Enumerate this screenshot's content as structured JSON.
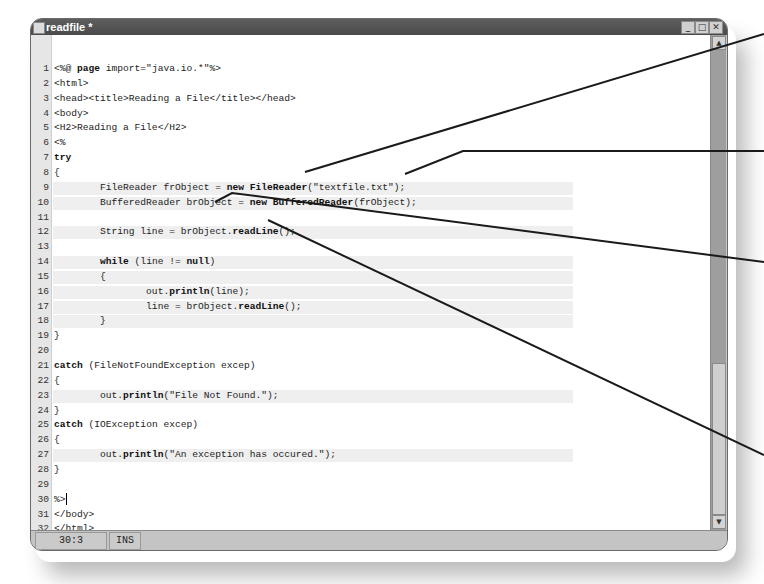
{
  "window": {
    "title": "readfile *",
    "buttons": {
      "minimize": "_",
      "maximize": "□",
      "close": "✕"
    }
  },
  "editor": {
    "lines": [
      {
        "n": "1",
        "segments": [
          {
            "t": "<%@ "
          },
          {
            "t": "page",
            "b": true
          },
          {
            "t": " import=\"java.io.*\"%>"
          }
        ]
      },
      {
        "n": "2",
        "segments": [
          {
            "t": "<html>"
          }
        ]
      },
      {
        "n": "3",
        "segments": [
          {
            "t": "<head><title>Reading a File</title></head>"
          }
        ]
      },
      {
        "n": "4",
        "segments": [
          {
            "t": "<body>"
          }
        ]
      },
      {
        "n": "5",
        "segments": [
          {
            "t": "<H2>Reading a File</H2>"
          }
        ]
      },
      {
        "n": "6",
        "segments": [
          {
            "t": "<%"
          }
        ]
      },
      {
        "n": "7",
        "segments": [
          {
            "t": "try",
            "b": true
          }
        ]
      },
      {
        "n": "8",
        "segments": [
          {
            "t": "{"
          }
        ]
      },
      {
        "n": "9",
        "hl": true,
        "segments": [
          {
            "t": "        FileReader frObject = "
          },
          {
            "t": "new FileReader",
            "b": true
          },
          {
            "t": "(\"textfile.txt\");"
          }
        ]
      },
      {
        "n": "10",
        "hl": true,
        "segments": [
          {
            "t": "        BufferedReader brObject = "
          },
          {
            "t": "new BufferedReader",
            "b": true
          },
          {
            "t": "(frObject);"
          }
        ]
      },
      {
        "n": "11",
        "segments": [
          {
            "t": ""
          }
        ]
      },
      {
        "n": "12",
        "hl": true,
        "segments": [
          {
            "t": "        String line = brObject."
          },
          {
            "t": "readLine",
            "b": true
          },
          {
            "t": "();"
          }
        ]
      },
      {
        "n": "13",
        "segments": [
          {
            "t": ""
          }
        ]
      },
      {
        "n": "14",
        "hl": true,
        "segments": [
          {
            "t": "        "
          },
          {
            "t": "while",
            "b": true
          },
          {
            "t": " (line != "
          },
          {
            "t": "null",
            "b": true
          },
          {
            "t": ")"
          }
        ]
      },
      {
        "n": "15",
        "hl": true,
        "segments": [
          {
            "t": "        {"
          }
        ]
      },
      {
        "n": "16",
        "hl": true,
        "segments": [
          {
            "t": "                out."
          },
          {
            "t": "println",
            "b": true
          },
          {
            "t": "(line);"
          }
        ]
      },
      {
        "n": "17",
        "hl": true,
        "segments": [
          {
            "t": "                line = brObject."
          },
          {
            "t": "readLine",
            "b": true
          },
          {
            "t": "();"
          }
        ]
      },
      {
        "n": "18",
        "hl": true,
        "segments": [
          {
            "t": "        }"
          }
        ]
      },
      {
        "n": "19",
        "segments": [
          {
            "t": "}"
          }
        ]
      },
      {
        "n": "20",
        "segments": [
          {
            "t": ""
          }
        ]
      },
      {
        "n": "21",
        "segments": [
          {
            "t": "catch",
            "b": true
          },
          {
            "t": " (FileNotFoundException excep)"
          }
        ]
      },
      {
        "n": "22",
        "segments": [
          {
            "t": "{"
          }
        ]
      },
      {
        "n": "23",
        "hl": true,
        "segments": [
          {
            "t": "        out."
          },
          {
            "t": "println",
            "b": true
          },
          {
            "t": "(\"File Not Found.\");"
          }
        ]
      },
      {
        "n": "24",
        "segments": [
          {
            "t": "}"
          }
        ]
      },
      {
        "n": "25",
        "segments": [
          {
            "t": "catch",
            "b": true
          },
          {
            "t": " (IOException excep)"
          }
        ]
      },
      {
        "n": "26",
        "segments": [
          {
            "t": "{"
          }
        ]
      },
      {
        "n": "27",
        "hl": true,
        "segments": [
          {
            "t": "        out."
          },
          {
            "t": "println",
            "b": true
          },
          {
            "t": "(\"An exception has occured.\");"
          }
        ]
      },
      {
        "n": "28",
        "segments": [
          {
            "t": "}"
          }
        ]
      },
      {
        "n": "29",
        "segments": [
          {
            "t": ""
          }
        ]
      },
      {
        "n": "30",
        "cursor": true,
        "segments": [
          {
            "t": "%>"
          }
        ]
      },
      {
        "n": "31",
        "segments": [
          {
            "t": "</body>"
          }
        ]
      },
      {
        "n": "32",
        "segments": [
          {
            "t": "</html>"
          }
        ]
      },
      {
        "n": "33",
        "segments": [
          {
            "t": ""
          }
        ]
      }
    ]
  },
  "scrollbar": {
    "up": "▲",
    "down": "▼"
  },
  "statusbar": {
    "position": "30:3",
    "mode": "INS"
  },
  "callouts": [
    {
      "points": "305,172 764,34"
    },
    {
      "points": "405,174 463,151 764,151"
    },
    {
      "points": "215,202 232,193 764,262"
    },
    {
      "points": "268,220 764,455"
    }
  ]
}
